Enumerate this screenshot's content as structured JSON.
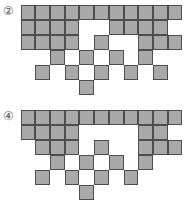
{
  "figures": [
    {
      "label": "②",
      "top": 5,
      "rows": [
        [
          0,
          1,
          2,
          3,
          4,
          5,
          6,
          7,
          8,
          9,
          10
        ],
        [
          0,
          1,
          2,
          3,
          6,
          7,
          8,
          9
        ],
        [
          0,
          1,
          2,
          3,
          5,
          8,
          9,
          10
        ],
        [
          2,
          4,
          6,
          8
        ],
        [
          1,
          3,
          5,
          7,
          9
        ],
        [
          4
        ]
      ]
    },
    {
      "label": "④",
      "top": 110,
      "rows": [
        [
          0,
          1,
          2,
          3,
          4,
          5,
          6,
          7,
          8,
          9,
          10
        ],
        [
          0,
          1,
          2,
          3,
          8,
          9
        ],
        [
          1,
          2,
          3,
          5,
          8,
          9,
          10
        ],
        [
          2,
          4,
          6,
          8
        ],
        [
          1,
          3,
          5,
          7
        ],
        [
          4
        ]
      ]
    }
  ],
  "colors": {
    "fill": "#a9a9a9",
    "border": "#4d4d4d"
  },
  "cell": {
    "width": 14.7,
    "height": 15
  }
}
